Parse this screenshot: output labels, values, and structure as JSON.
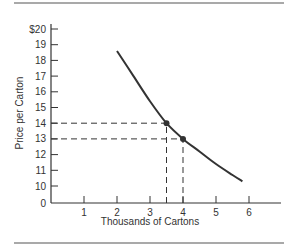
{
  "chart_data": {
    "type": "line",
    "title": "",
    "xlabel": "Thousands of Cartons",
    "ylabel": "Price per Carton",
    "x_ticks": [
      "1",
      "2",
      "3",
      "4",
      "5",
      "6"
    ],
    "y_ticks": [
      "$20",
      "19",
      "18",
      "17",
      "16",
      "15",
      "14",
      "13",
      "12",
      "11",
      "10",
      "0"
    ],
    "y_axis_break": "axis jumps from 0 to 10",
    "xlim": [
      0,
      7
    ],
    "ylim": [
      10,
      20
    ],
    "grid": false,
    "legend": null,
    "series": [
      {
        "name": "Demand curve",
        "x": [
          2.0,
          2.5,
          3.0,
          3.5,
          4.0,
          4.5,
          5.0,
          5.5,
          5.8
        ],
        "y": [
          18.6,
          17.0,
          15.4,
          14.0,
          13.0,
          12.2,
          11.4,
          10.7,
          10.3
        ]
      }
    ],
    "highlighted_points": [
      {
        "x": 3.5,
        "y": 14
      },
      {
        "x": 4.0,
        "y": 13
      }
    ],
    "reference_lines": [
      {
        "type": "horizontal",
        "y": 14,
        "from_x": 0,
        "to_x": 3.5,
        "style": "dashed"
      },
      {
        "type": "horizontal",
        "y": 13,
        "from_x": 0,
        "to_x": 4.0,
        "style": "dashed"
      },
      {
        "type": "vertical",
        "x": 3.5,
        "from_y": 0,
        "to_y": 14,
        "style": "dashed"
      },
      {
        "type": "vertical",
        "x": 4.0,
        "from_y": 0,
        "to_y": 13,
        "style": "dashed"
      }
    ]
  },
  "labels": {
    "xlabel": "Thousands of Cartons",
    "ylabel": "Price per Carton",
    "y_ticks": [
      "$20",
      "19",
      "18",
      "17",
      "16",
      "15",
      "14",
      "13",
      "12",
      "11",
      "10",
      "0"
    ],
    "x_ticks": [
      "1",
      "2",
      "3",
      "4",
      "5",
      "6"
    ]
  },
  "colors": {
    "line": "#333333",
    "text": "#333333",
    "rule": "#555555"
  }
}
